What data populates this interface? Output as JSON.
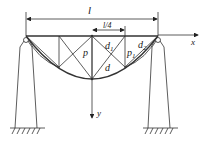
{
  "diagram": {
    "type": "suspension-truss-bridge-schematic",
    "line_color": "#333333",
    "labels": {
      "span": "l",
      "quarter_span": "l/4",
      "x_axis": "x",
      "y_axis": "y",
      "post_center": "p",
      "post_right": "p",
      "post_right_sub": "1",
      "diag_upper": "d",
      "diag_upper_sub": "1",
      "diag_lower": "d",
      "diag_right": "d",
      "diag_right_sub": "2"
    }
  }
}
